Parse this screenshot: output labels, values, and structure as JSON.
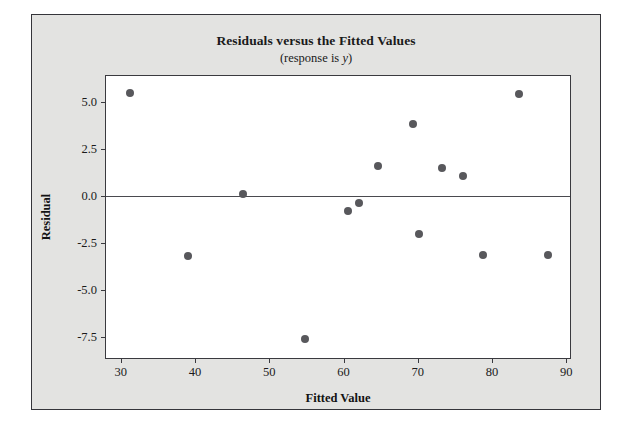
{
  "chart_data": {
    "type": "scatter",
    "title": "Residuals versus the Fitted Values",
    "subtitle_prefix": "(response is ",
    "subtitle_variable": "y",
    "subtitle_suffix": ")",
    "xlabel": "Fitted Value",
    "ylabel": "Residual",
    "xlim": [
      28,
      90.5
    ],
    "ylim": [
      -8.6,
      6.4
    ],
    "xticks": [
      30,
      40,
      50,
      60,
      70,
      80,
      90
    ],
    "xtick_labels": [
      "30",
      "40",
      "50",
      "60",
      "70",
      "80",
      "90"
    ],
    "yticks": [
      5.0,
      2.5,
      0.0,
      -2.5,
      -5.0,
      -7.5
    ],
    "ytick_labels": [
      "5.0",
      "2.5",
      "0.0",
      "-2.5",
      "-5.0",
      "-7.5"
    ],
    "grid": false,
    "legend": null,
    "reference_line": {
      "orientation": "horizontal",
      "value": 0.0
    },
    "marker": {
      "shape": "circle",
      "color": "#58585c",
      "size": 8
    },
    "points": [
      {
        "x": 31.2,
        "y": 5.5
      },
      {
        "x": 39.0,
        "y": -3.2
      },
      {
        "x": 46.5,
        "y": 0.15
      },
      {
        "x": 54.8,
        "y": -7.6
      },
      {
        "x": 60.6,
        "y": -0.8
      },
      {
        "x": 62.1,
        "y": -0.35
      },
      {
        "x": 64.7,
        "y": 1.6
      },
      {
        "x": 69.3,
        "y": 3.85
      },
      {
        "x": 70.2,
        "y": -2.0
      },
      {
        "x": 73.3,
        "y": 1.5
      },
      {
        "x": 76.1,
        "y": 1.1
      },
      {
        "x": 78.8,
        "y": -3.1
      },
      {
        "x": 83.6,
        "y": 5.45
      },
      {
        "x": 87.6,
        "y": -3.1
      }
    ]
  },
  "colors": {
    "figure_background": "#e3e3e1",
    "plot_background": "#ffffff",
    "frame": "#3a3a3f",
    "marker": "#58585c",
    "text": "#1a1a1a"
  }
}
